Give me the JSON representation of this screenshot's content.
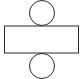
{
  "diagram": {
    "type": "cylinder-net",
    "stroke_color": "#2a2a2a",
    "background": "#ffffff",
    "shapes": {
      "top_circle": {
        "cx": 42,
        "cy": 13,
        "r": 12.5
      },
      "rectangle": {
        "x": 4.5,
        "y": 26,
        "width": 74,
        "height": 27
      },
      "bottom_circle": {
        "cx": 42,
        "cy": 66,
        "r": 12.5
      }
    }
  }
}
